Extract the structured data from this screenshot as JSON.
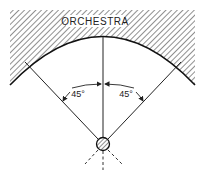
{
  "diagram": {
    "orchestra_label": "ORCHESTRA",
    "angle_left_label": "45°",
    "angle_right_label": "45°",
    "elements": {
      "orchestra_area": "hatched region above curved edge",
      "listener": "hatched circle source/listener at bottom center",
      "sight_lines": [
        "left 45° line",
        "center vertical line",
        "right 45° line"
      ],
      "dashed_lines": 3
    },
    "colors": {
      "ink": "#222222",
      "background": "#ffffff"
    }
  }
}
